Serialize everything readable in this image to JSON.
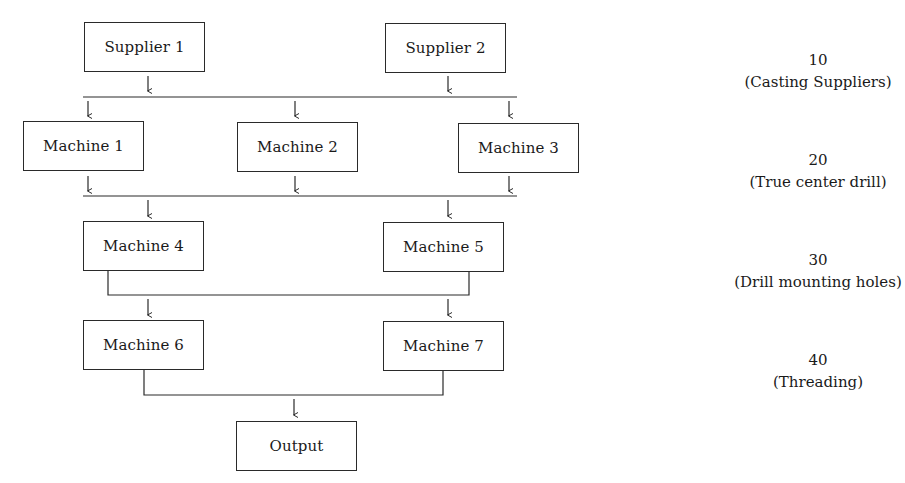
{
  "diagram": {
    "nodes": {
      "supplier1": {
        "label": "Supplier 1"
      },
      "supplier2": {
        "label": "Supplier 2"
      },
      "machine1": {
        "label": "Machine 1"
      },
      "machine2": {
        "label": "Machine 2"
      },
      "machine3": {
        "label": "Machine 3"
      },
      "machine4": {
        "label": "Machine 4"
      },
      "machine5": {
        "label": "Machine 5"
      },
      "machine6": {
        "label": "Machine 6"
      },
      "machine7": {
        "label": "Machine 7"
      },
      "output": {
        "label": "Output"
      }
    },
    "stages": [
      {
        "code": "10",
        "description": "(Casting Suppliers)"
      },
      {
        "code": "20",
        "description": "(True center drill)"
      },
      {
        "code": "30",
        "description": "(Drill mounting holes)"
      },
      {
        "code": "40",
        "description": "(Threading)"
      }
    ],
    "edges": [
      {
        "from": [
          "Supplier 1",
          "Supplier 2"
        ],
        "to": [
          "Machine 1",
          "Machine 2",
          "Machine 3"
        ]
      },
      {
        "from": [
          "Machine 1",
          "Machine 2",
          "Machine 3"
        ],
        "to": [
          "Machine 4",
          "Machine 5"
        ]
      },
      {
        "from": [
          "Machine 4",
          "Machine 5"
        ],
        "to": [
          "Machine 6",
          "Machine 7"
        ]
      },
      {
        "from": [
          "Machine 6",
          "Machine 7"
        ],
        "to": [
          "Output"
        ]
      }
    ]
  }
}
